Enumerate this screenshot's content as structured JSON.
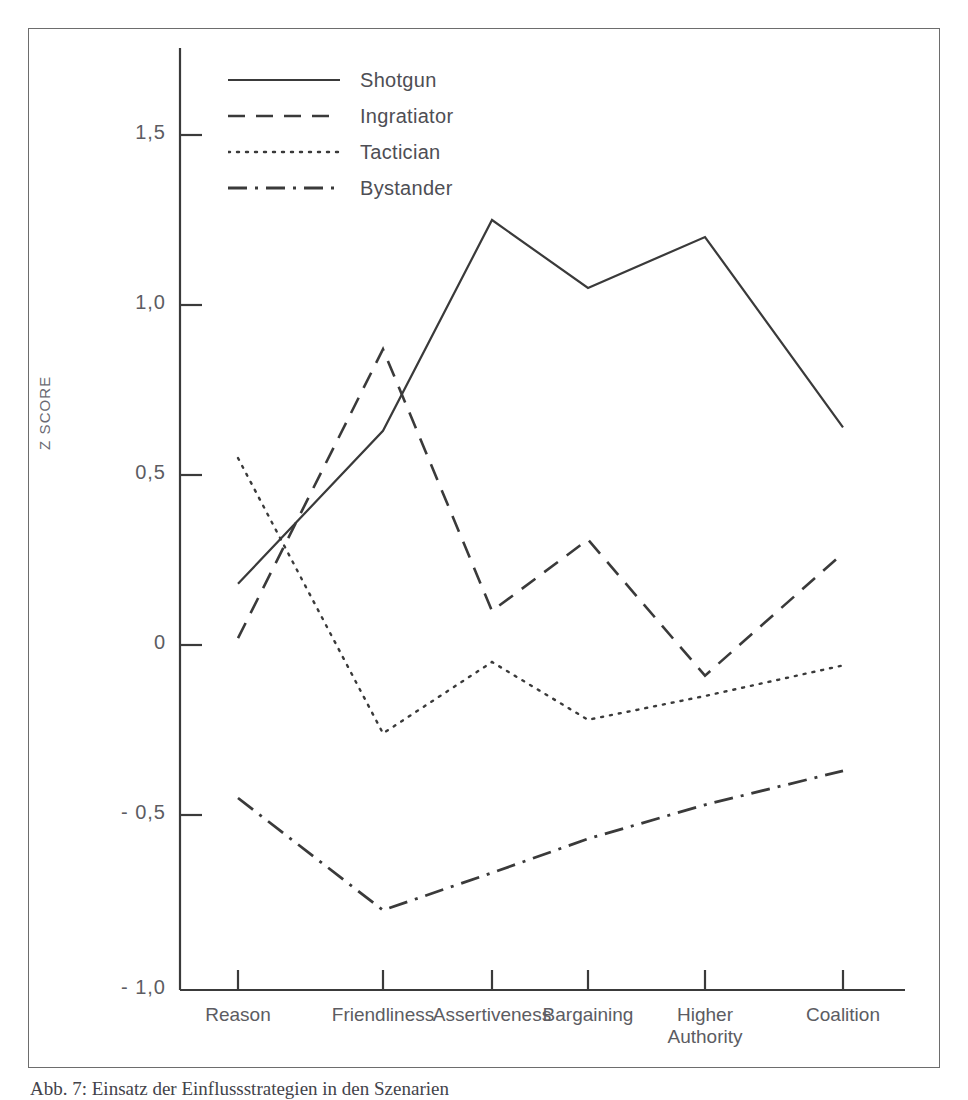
{
  "figure": {
    "caption": "Abb. 7: Einsatz der Einflussstrategien in den Szenarien",
    "y_axis_title": "Z SCORE"
  },
  "legend": {
    "items": [
      {
        "label": "Shotgun",
        "style": "solid",
        "icon": "line-solid-icon"
      },
      {
        "label": "Ingratiator",
        "style": "dashed",
        "icon": "line-dashed-icon"
      },
      {
        "label": "Tactician",
        "style": "dotted",
        "icon": "line-dotted-icon"
      },
      {
        "label": "Bystander",
        "style": "dashdot",
        "icon": "line-dashdot-icon"
      }
    ]
  },
  "axes": {
    "y_ticks": [
      {
        "label": "1,5",
        "value": 1.5
      },
      {
        "label": "1,0",
        "value": 1.0
      },
      {
        "label": "0,5",
        "value": 0.5
      },
      {
        "label": "0",
        "value": 0.0
      },
      {
        "label": "- 0,5",
        "value": -0.5
      },
      {
        "label": "- 1,0",
        "value": -1.0
      }
    ],
    "x_ticks": [
      {
        "label": "Reason"
      },
      {
        "label": "Friendliness"
      },
      {
        "label": "Assertiveness"
      },
      {
        "label": "Bargaining"
      },
      {
        "label": "Higher\nAuthority"
      },
      {
        "label": "Coalition"
      }
    ]
  },
  "chart_data": {
    "type": "line",
    "title": "",
    "xlabel": "",
    "ylabel": "Z SCORE",
    "ylim": [
      -1.0,
      1.75
    ],
    "grid": false,
    "legend_position": "top-left-inside",
    "categories": [
      "Reason",
      "Friendliness",
      "Assertiveness",
      "Bargaining",
      "Higher Authority",
      "Coalition"
    ],
    "series": [
      {
        "name": "Shotgun",
        "style": "solid",
        "color": "#3a3a3a",
        "values": [
          0.18,
          0.63,
          1.25,
          1.05,
          1.2,
          0.64
        ]
      },
      {
        "name": "Ingratiator",
        "style": "dashed",
        "color": "#3a3a3a",
        "values": [
          0.02,
          0.87,
          0.1,
          0.31,
          -0.09,
          0.27
        ]
      },
      {
        "name": "Tactician",
        "style": "dotted",
        "color": "#3a3a3a",
        "values": [
          0.55,
          -0.26,
          -0.05,
          -0.22,
          -0.15,
          -0.06
        ]
      },
      {
        "name": "Bystander",
        "style": "dashdot",
        "color": "#3a3a3a",
        "values": [
          -0.45,
          -0.78,
          -0.67,
          -0.57,
          -0.47,
          -0.37
        ]
      }
    ]
  },
  "colors": {
    "ink": "#3a3a3a",
    "frame": "#6d6d6d",
    "label": "#5c5c62",
    "background": "#ffffff"
  }
}
